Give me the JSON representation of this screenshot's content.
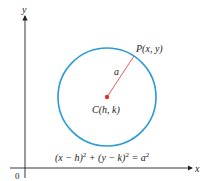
{
  "axes": {
    "x_label": "x",
    "y_label": "y",
    "origin_label": "0"
  },
  "circle": {
    "color": "#2a9bd6",
    "center_color": "#e0322b",
    "radius_color": "#e0322b"
  },
  "labels": {
    "point": "P(x, y)",
    "radius": "a",
    "center": "C(h, k)",
    "equation_left": "(x − h)",
    "equation_mid": " + (y − k)",
    "equation_right": " = a",
    "exp": "2"
  }
}
